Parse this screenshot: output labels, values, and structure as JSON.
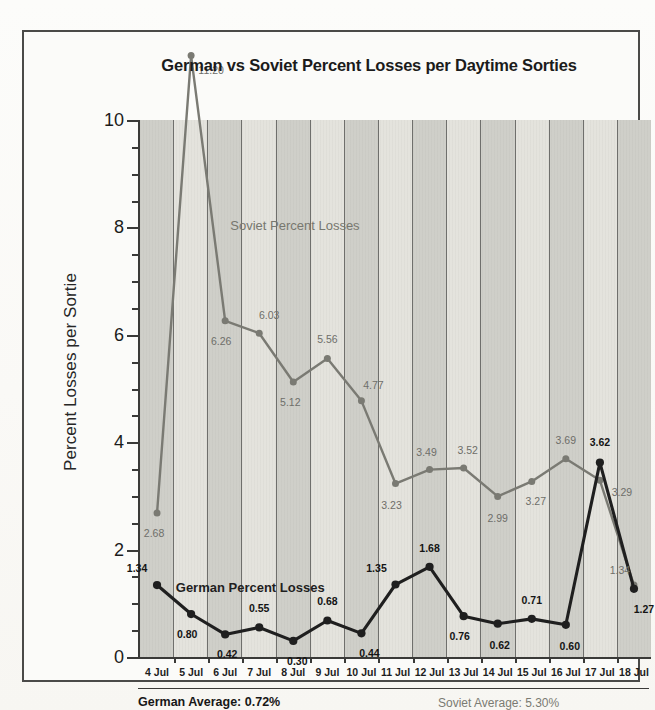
{
  "chart_data": {
    "type": "line",
    "title": "German vs Soviet Percent Losses per Daytime Sorties",
    "xlabel": "",
    "ylabel": "Percent Losses per Sortie",
    "ylim": [
      0,
      10
    ],
    "ytick_labels": [
      "0",
      "2",
      "4",
      "6",
      "8",
      "10"
    ],
    "ytick_values": [
      0,
      2,
      4,
      6,
      8,
      10
    ],
    "minor_tick_step": 0.5,
    "grid": "vertical-bands",
    "legend": "inline-labels",
    "categories": [
      "4 Jul",
      "5 Jul",
      "6 Jul",
      "7 Jul",
      "8 Jul",
      "9 Jul",
      "10 Jul",
      "11 Jul",
      "12 Jul",
      "13 Jul",
      "14 Jul",
      "15 Jul",
      "16 Jul",
      "17 Jul",
      "18 Jul"
    ],
    "series": [
      {
        "name": "German Percent Losses",
        "color": "#1f1f1f",
        "values": [
          1.34,
          0.8,
          0.42,
          0.55,
          0.3,
          0.68,
          0.44,
          1.35,
          1.68,
          0.76,
          0.62,
          0.71,
          0.6,
          3.62,
          1.27
        ],
        "labels": [
          "1.34",
          "0.80",
          "0.42",
          "0.55",
          "0.30",
          "0.68",
          "0.44",
          "1.35",
          "1.68",
          "0.76",
          "0.62",
          "0.71",
          "0.60",
          "3.62",
          "1.27"
        ]
      },
      {
        "name": "Soviet Percent Losses",
        "color": "#7a7a73",
        "values": [
          2.68,
          11.2,
          6.26,
          6.03,
          5.12,
          5.56,
          4.77,
          3.23,
          3.49,
          3.52,
          2.99,
          3.27,
          3.69,
          3.29,
          1.34
        ],
        "labels": [
          "2.68",
          "11.20",
          "6.26",
          "6.03",
          "5.12",
          "5.56",
          "4.77",
          "3.23",
          "3.49",
          "3.52",
          "2.99",
          "3.27",
          "3.69",
          "3.29",
          "1.34"
        ]
      }
    ],
    "annotations": [
      {
        "text": "Soviet Percent Losses",
        "x_index": 2.15,
        "y": 8.05,
        "series": "soviet"
      },
      {
        "text": "German Percent Losses",
        "x_index": 0.55,
        "y": 1.3,
        "series": "german"
      }
    ]
  },
  "footer": {
    "german_average": "German Average: 0.72%",
    "soviet_average": "Soviet Average: 5.30%"
  }
}
